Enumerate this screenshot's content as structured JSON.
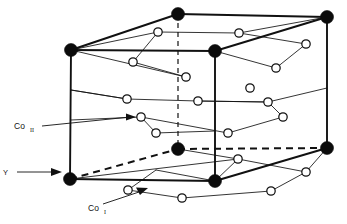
{
  "figure": {
    "background_color": "#ffffff",
    "line_color": "#111111",
    "filled_atom_color": "#0b0b0b",
    "open_atom_fill": "#ffffff"
  },
  "labels": {
    "co2": {
      "base": "Co",
      "sub": "II",
      "full": "Co₂"
    },
    "co1": {
      "base": "Co",
      "sub": "I",
      "full": "Co₁"
    },
    "axis_y": "Y"
  },
  "legend": {
    "filled_meaning": "Co atom (unit cell corner / edge site)",
    "open_meaning": "ligand atom"
  },
  "structure": {
    "unit_cell_type": "oblique projection of a rectangular unit cell",
    "filled_atoms": [
      {
        "name": "top-back-left",
        "x": 178,
        "y": 14
      },
      {
        "name": "top-back-right",
        "x": 327,
        "y": 17
      },
      {
        "name": "top-front-left",
        "x": 71,
        "y": 50
      },
      {
        "name": "top-front-right",
        "x": 215,
        "y": 51
      },
      {
        "name": "bottom-back-left",
        "x": 178,
        "y": 149
      },
      {
        "name": "bottom-back-right",
        "x": 327,
        "y": 148
      },
      {
        "name": "bottom-front-left",
        "x": 70,
        "y": 179
      },
      {
        "name": "bottom-front-right",
        "x": 215,
        "y": 181
      }
    ],
    "open_atoms": [
      {
        "id": "o1",
        "x": 158,
        "y": 32
      },
      {
        "id": "o2",
        "x": 239,
        "y": 33
      },
      {
        "id": "o3",
        "x": 133,
        "y": 62
      },
      {
        "id": "o4",
        "x": 306,
        "y": 44
      },
      {
        "id": "o5",
        "x": 276,
        "y": 68
      },
      {
        "id": "o6",
        "x": 186,
        "y": 77
      },
      {
        "id": "o7",
        "x": 250,
        "y": 88
      },
      {
        "id": "o8",
        "x": 127,
        "y": 99
      },
      {
        "id": "o9",
        "x": 198,
        "y": 101
      },
      {
        "id": "o10",
        "x": 268,
        "y": 102
      },
      {
        "id": "o11",
        "x": 141,
        "y": 117
      },
      {
        "id": "o12",
        "x": 283,
        "y": 117
      },
      {
        "id": "o13",
        "x": 156,
        "y": 133
      },
      {
        "id": "o14",
        "x": 228,
        "y": 133
      },
      {
        "id": "o15",
        "x": 238,
        "y": 159
      },
      {
        "id": "o16",
        "x": 306,
        "y": 172
      },
      {
        "id": "o17",
        "x": 128,
        "y": 190
      },
      {
        "id": "o18",
        "x": 271,
        "y": 191
      },
      {
        "id": "o19",
        "x": 182,
        "y": 198
      }
    ]
  }
}
